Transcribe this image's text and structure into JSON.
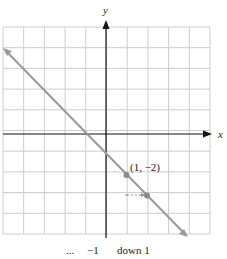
{
  "chart_data": {
    "type": "line",
    "title": "",
    "xlabel": "x",
    "ylabel": "y",
    "xlim": [
      -5,
      5
    ],
    "ylim": [
      -5,
      5
    ],
    "grid": true,
    "grid_step": 1,
    "series": [
      {
        "name": "y = -x - 1",
        "slope": -1,
        "intercept": -1,
        "x": [
          -5,
          4
        ],
        "y": [
          4,
          -5
        ],
        "arrows_both_ends": true,
        "color": "#999999"
      }
    ],
    "points": [
      {
        "x": 1,
        "y": -2,
        "label": "(1, −2)"
      },
      {
        "x": 2,
        "y": -3,
        "label": ""
      }
    ],
    "annotations": [
      {
        "type": "dashed-arrow",
        "from": [
          1,
          -3
        ],
        "to": [
          2,
          -3
        ],
        "description": "run right 1"
      }
    ]
  },
  "labels": {
    "x_axis": "x",
    "y_axis": "y",
    "point_label": "(1, −2)"
  },
  "caption": {
    "ellipsis": "...",
    "slope_numerator": "−1",
    "rise_text": "down 1"
  },
  "colors": {
    "grid": "#cccccc",
    "axis": "#111111",
    "line": "#999999",
    "point": "#8a8a8a"
  }
}
